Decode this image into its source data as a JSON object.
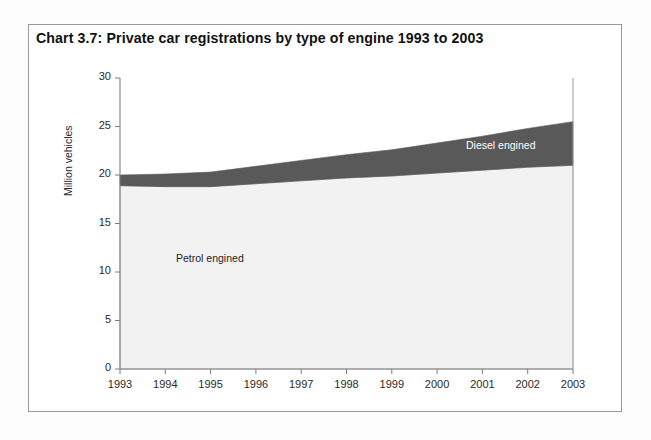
{
  "figure": {
    "title": "Chart 3.7:  Private car registrations by type of engine 1993 to 2003",
    "frame_color": "#9a9a9a",
    "background": "#ffffff"
  },
  "labels": {
    "diesel": "Diesel engined",
    "petrol": "Petrol engined",
    "y_axis": "Million vehicles"
  },
  "chart_data": {
    "type": "area",
    "title": "Chart 3.7:  Private car registrations by type of engine 1993 to 2003",
    "subtitle": "",
    "xlabel": "",
    "ylabel": "Million vehicles",
    "stacked": true,
    "grid": false,
    "legend_position": "inline-annotations",
    "categories": [
      "1993",
      "1994",
      "1995",
      "1996",
      "1997",
      "1998",
      "1999",
      "2000",
      "2001",
      "2002",
      "2003"
    ],
    "x": [
      1993,
      1994,
      1995,
      1996,
      1997,
      1998,
      1999,
      2000,
      2001,
      2002,
      2003
    ],
    "ylim": [
      0,
      30
    ],
    "yticks": [
      0,
      5,
      10,
      15,
      20,
      25,
      30
    ],
    "xlim": [
      1993,
      2003
    ],
    "series": [
      {
        "name": "Petrol engined",
        "color": "#f2f2f2",
        "label_color": "#1e1e1e",
        "values": [
          18.9,
          18.8,
          18.8,
          19.1,
          19.4,
          19.7,
          19.9,
          20.2,
          20.5,
          20.8,
          21.0
        ]
      },
      {
        "name": "Diesel engined",
        "color": "#595959",
        "label_color": "#ffffff",
        "values": [
          1.1,
          1.3,
          1.5,
          1.8,
          2.1,
          2.4,
          2.7,
          3.1,
          3.5,
          4.0,
          4.5
        ]
      }
    ],
    "totals": [
      20.0,
      20.1,
      20.3,
      20.9,
      21.5,
      22.1,
      22.6,
      23.3,
      24.0,
      24.8,
      25.5
    ]
  }
}
